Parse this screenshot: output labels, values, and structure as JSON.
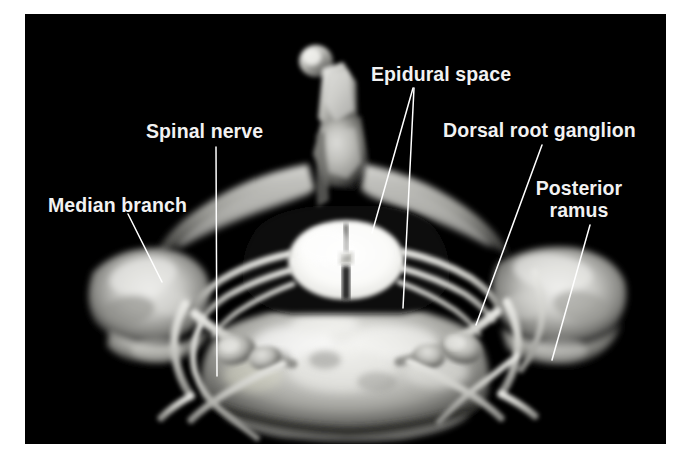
{
  "figure": {
    "kind": "anatomical-cross-section",
    "background_color": "#ffffff",
    "photo_color": "#000000",
    "label_color": "#f2f2f2",
    "leader_color": "#ffffff"
  },
  "labels": [
    {
      "id": "median-branch",
      "text": "Median branch",
      "x": 48,
      "y": 194,
      "align": "left"
    },
    {
      "id": "spinal-nerve",
      "text": "Spinal nerve",
      "x": 146,
      "y": 120,
      "align": "left"
    },
    {
      "id": "epidural-space",
      "text": "Epidural space",
      "x": 371,
      "y": 63,
      "align": "left"
    },
    {
      "id": "dorsal-root-ganglion",
      "text": "Dorsal root ganglion",
      "x": 443,
      "y": 119,
      "align": "left"
    },
    {
      "id": "posterior-ramus-line1",
      "text": "Posterior",
      "x": 553,
      "y": 177,
      "align": "center"
    },
    {
      "id": "posterior-ramus-line2",
      "text": "ramus",
      "x": 553,
      "y": 199,
      "align": "center"
    }
  ],
  "leader_lines": [
    {
      "id": "leader-median-branch",
      "points": "103,200 137,268"
    },
    {
      "id": "leader-spinal-nerve",
      "points": "191,133 192,362"
    },
    {
      "id": "leader-epidural-space-a",
      "points": "388,74 347,219"
    },
    {
      "id": "leader-epidural-space-b",
      "points": "389,74 378,294"
    },
    {
      "id": "leader-dorsal-root-ganglion",
      "points": "517,131 451,311"
    },
    {
      "id": "leader-posterior-ramus",
      "points": "565,211 527,346"
    }
  ],
  "anatomy": [
    {
      "id": "spinous-process",
      "name": "Bifid spinous process"
    },
    {
      "id": "lamina",
      "name": "Vertebral lamina"
    },
    {
      "id": "spinal-cord",
      "name": "Spinal cord"
    },
    {
      "id": "central-canal",
      "name": "Central canal"
    },
    {
      "id": "posterior-median-sulcus",
      "name": "Posterior median sulcus"
    },
    {
      "id": "anterior-median-fissure",
      "name": "Anterior median fissure"
    },
    {
      "id": "vertebral-body",
      "name": "Vertebral body"
    },
    {
      "id": "transverse-process-left",
      "name": "Left transverse process"
    },
    {
      "id": "transverse-process-right",
      "name": "Right transverse process"
    },
    {
      "id": "dorsal-root-ganglion-left",
      "name": "Left dorsal root ganglion"
    },
    {
      "id": "dorsal-root-ganglion-right",
      "name": "Right dorsal root ganglion"
    },
    {
      "id": "nerve-root-left",
      "name": "Left spinal nerve root"
    },
    {
      "id": "nerve-root-right",
      "name": "Right spinal nerve root"
    }
  ]
}
